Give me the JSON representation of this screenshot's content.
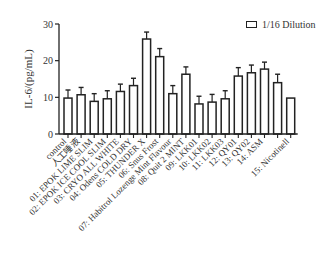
{
  "chart_data": {
    "type": "bar",
    "title": "",
    "xlabel": "",
    "ylabel": "IL-6/(pg/mL)",
    "ylim": [
      0,
      30
    ],
    "yticks": [
      0,
      10,
      20,
      30
    ],
    "grid": false,
    "legend_position": "top-right",
    "series": [
      {
        "name": "1/16 Dilution",
        "values": [
          9.8,
          10.7,
          8.9,
          9.6,
          11.6,
          13.2,
          25.9,
          21.1,
          11.0,
          16.3,
          8.2,
          8.7,
          9.6,
          15.8,
          16.7,
          17.7,
          14.0,
          9.8
        ],
        "error_upper": [
          12.0,
          12.7,
          11.0,
          11.8,
          13.6,
          15.2,
          27.8,
          23.3,
          13.2,
          18.3,
          10.3,
          10.8,
          11.8,
          18.1,
          18.8,
          19.6,
          16.3,
          null
        ]
      }
    ],
    "categories": [
      "control",
      "人工唾液",
      "01: EPOK LIME SLIM",
      "02: EPOK ICE COOL SLIM",
      "03: CRYO ALL WHITE",
      "04: Odens COLD DRY",
      "05: THUNDER X",
      "06: Snus Frost",
      "07: Habitrol Lozenge Mint Flavour",
      "08: Quit 2 MINT",
      "09: LKK01",
      "10: LKK02",
      "11: LKK03",
      "12: QY01",
      "13: QY02",
      "14: ASM",
      "",
      "15: Nicotinell"
    ]
  },
  "legend": {
    "label": "1/16 Dilution"
  },
  "colors": {
    "axis": "#222222",
    "bar_fill": "#ffffff",
    "bar_stroke": "#222222",
    "text": "#333333"
  }
}
